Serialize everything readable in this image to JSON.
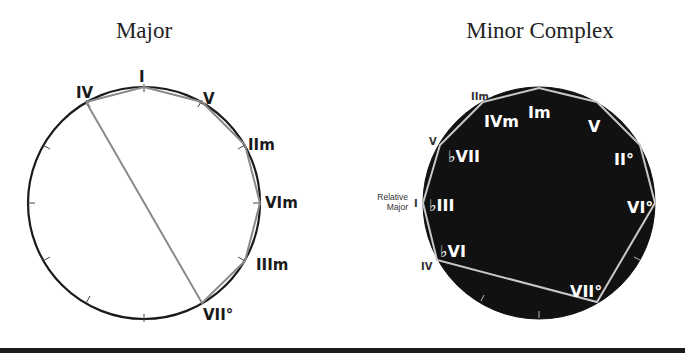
{
  "titles": {
    "major": "Major",
    "minor": "Minor Complex"
  },
  "major_diagram": {
    "labels": {
      "I": "I",
      "V": "V",
      "IIm": "IIm",
      "VIm": "VIm",
      "IIIm": "IIIm",
      "VIIo": "VII°",
      "IV": "IV"
    },
    "ring_colors": {
      "circle": "#1a1a1a",
      "path": "#8a8a8a"
    }
  },
  "minor_diagram": {
    "inner_labels": {
      "Im": "Im",
      "V": "V",
      "IIo": "II°",
      "VIo": "VI°",
      "VIIo": "VII°",
      "bVI": "♭VI",
      "bIII": "♭III",
      "bVII": "♭VII",
      "IVm": "IVm"
    },
    "outer_labels": {
      "IIm": "IIm",
      "V": "V",
      "I": "I",
      "IV": "IV"
    },
    "relative_major_note": [
      "Relative",
      "Major"
    ],
    "colors": {
      "disc": "#111111",
      "path": "#c8c8c8",
      "text": "#ffffff"
    }
  }
}
